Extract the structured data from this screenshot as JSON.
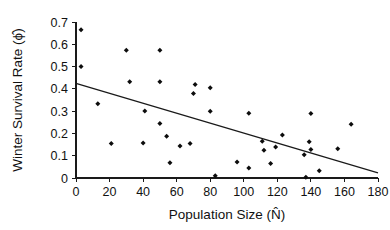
{
  "chart_data": {
    "type": "scatter",
    "title": "",
    "xlabel": "Population Size (N̂)",
    "ylabel": "Winter Survival Rate (ϕ̂)",
    "xlabel_plain": "Population Size (N)",
    "ylabel_plain": "Winter Survival Rate (phi)",
    "xlim": [
      0,
      180
    ],
    "ylim": [
      0,
      0.7
    ],
    "xticks": [
      0,
      20,
      40,
      60,
      80,
      100,
      120,
      140,
      160,
      180
    ],
    "xtick_labels": [
      "0",
      "20",
      "40",
      "60",
      "80",
      "100",
      "120",
      "140",
      "160",
      "180"
    ],
    "yticks": [
      0,
      0.1,
      0.2,
      0.3,
      0.4,
      0.5,
      0.6,
      0.7
    ],
    "ytick_labels": [
      "0",
      "0.1",
      "0.2",
      "0.3",
      "0.4",
      "0.5",
      "0.6",
      "0.7"
    ],
    "grid": false,
    "legend": null,
    "marker": "diamond",
    "marker_color": "#0d0d0d",
    "line_color": "#1a1a1a",
    "points": [
      {
        "x": 3,
        "y": 0.665
      },
      {
        "x": 3,
        "y": 0.5
      },
      {
        "x": 13,
        "y": 0.333
      },
      {
        "x": 21,
        "y": 0.155
      },
      {
        "x": 30,
        "y": 0.573
      },
      {
        "x": 32,
        "y": 0.432
      },
      {
        "x": 40,
        "y": 0.157
      },
      {
        "x": 41,
        "y": 0.301
      },
      {
        "x": 50,
        "y": 0.573
      },
      {
        "x": 50,
        "y": 0.432
      },
      {
        "x": 50,
        "y": 0.245
      },
      {
        "x": 54,
        "y": 0.187
      },
      {
        "x": 56,
        "y": 0.068
      },
      {
        "x": 62,
        "y": 0.144
      },
      {
        "x": 68,
        "y": 0.155
      },
      {
        "x": 70,
        "y": 0.379
      },
      {
        "x": 71,
        "y": 0.419
      },
      {
        "x": 80,
        "y": 0.405
      },
      {
        "x": 80,
        "y": 0.299
      },
      {
        "x": 83,
        "y": 0.01
      },
      {
        "x": 96,
        "y": 0.072
      },
      {
        "x": 103,
        "y": 0.291
      },
      {
        "x": 103,
        "y": 0.045
      },
      {
        "x": 111,
        "y": 0.165
      },
      {
        "x": 112,
        "y": 0.124
      },
      {
        "x": 116,
        "y": 0.065
      },
      {
        "x": 119,
        "y": 0.139
      },
      {
        "x": 123,
        "y": 0.193
      },
      {
        "x": 136,
        "y": 0.104
      },
      {
        "x": 137,
        "y": 0.003
      },
      {
        "x": 139,
        "y": 0.163
      },
      {
        "x": 140,
        "y": 0.289
      },
      {
        "x": 140,
        "y": 0.128
      },
      {
        "x": 145,
        "y": 0.033
      },
      {
        "x": 156,
        "y": 0.131
      },
      {
        "x": 164,
        "y": 0.241
      }
    ],
    "trendline": {
      "x_start": 0,
      "y_start": 0.425,
      "x_end": 180,
      "y_end": 0.023
    }
  }
}
